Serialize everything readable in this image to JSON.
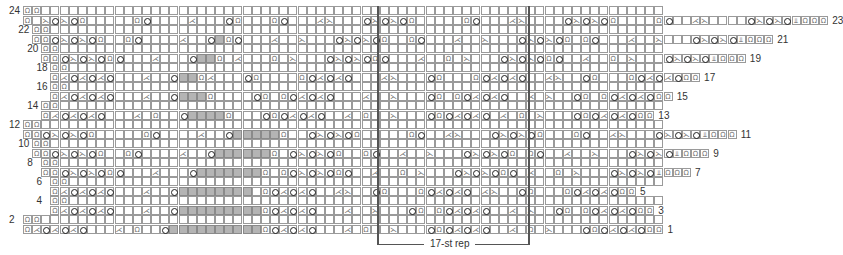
{
  "chart": {
    "cell_width": 9.15,
    "cell_height": 9.5,
    "origin_x": 23,
    "origin_y": 6,
    "colors": {
      "grid": "#9a9a9a",
      "no_stitch": "#b4b4b4",
      "symbol": "#222222",
      "bracket": "#555555"
    },
    "symbol_legend": {
      "O": "yarn-over",
      "R": "ssk-right-slant",
      "L": "k2tog-left-slant",
      "Q": "twisted-knit",
      "D": "double-decrease",
      ".": "knit",
      "#": "no-stitch"
    },
    "rows": [
      {
        "num": 24,
        "side": "left",
        "start": 0,
        "cells": "QQ"
      },
      {
        "num": 23,
        "side": "right",
        "start": 0,
        "cells": "QQO R O R O Q . . . . . Q O . . . . L . . . O Q . . . Q O . . . L R . . . O R O R O Q . . . . . Q O . . . L R . . . . O R O R O Q . . . . Q O . . L R . . . . O R O R O D Q QQ"
      },
      {
        "num": 22,
        "side": "left",
        "start": 1,
        "cells": "QQ"
      },
      {
        "num": 21,
        "side": "right",
        "start": 1,
        "cells": "Q Q O R O R O Q . . Q O . . . . L . . O # Q O . . . L . . R . . . O R O R O Q . . Q O . . . L . . R . . . O R O R O Q . Q O . . . L . . R . . . O R O R O D Q QQ"
      },
      {
        "num": 20,
        "side": "left",
        "start": 2,
        "cells": "QQ"
      },
      {
        "num": 19,
        "side": "right",
        "start": 2,
        "cells": "Q Q O R O R O Q O . . . L . . . O # # Q . L . . . Q . R . . . O R O R O Q O . . . L . . Q . R . . . O R O R O Q O . . L . . Q . R . . . O R O R O D Q QQ"
      },
      {
        "num": 18,
        "side": "left",
        "start": 3,
        "cells": "QQ"
      },
      {
        "num": 17,
        "side": "right",
        "start": 3,
        "cells": "Q L O L O L O . . . L . . O # # Q L . . . O Q . . . . Q O L O L O . . . L R . . . O Q . . . Q O L O L O . . L R . . O Q . . . Q O L O L O Q Q"
      },
      {
        "num": 16,
        "side": "left",
        "start": 3,
        "cells": "QQ"
      },
      {
        "num": 15,
        "side": "right",
        "start": 3,
        "cells": "Q L O L O L O . . . L . . O # # # Q . . . . O Q . Q O L O L O . . . L . . R . . . O Q . Q O L O L O . . L . R . . O Q . Q O L O L O Q Q"
      },
      {
        "num": 14,
        "side": "left",
        "start": 2,
        "cells": "QQ"
      },
      {
        "num": 13,
        "side": "right",
        "start": 2,
        "cells": "Q L O L O L O . . . L . Q . . O # # # # Q . . . O Q O L O L O . . L . Q . . R . . . O Q O L O L O . L . Q . R . . . O Q O L O L O Q Q"
      },
      {
        "num": 12,
        "side": "left",
        "start": 0,
        "cells": "QQ"
      },
      {
        "num": 11,
        "side": "right",
        "start": 0,
        "cells": "Q Q O R O R O Q . . . . . Q O . . . . L . . O # # # # # Q . . O R O R O Q . . . . . Q O . . L R . . . O R O R O Q . . . Q O . . L R . . . O R O R O D Q QQ"
      },
      {
        "num": 10,
        "side": "left",
        "start": 1,
        "cells": "QQ"
      },
      {
        "num": 9,
        "side": "right",
        "start": 1,
        "cells": "Q Q O R O R O Q . . Q O . . . . L . . O # # # # # # Q . O R O R O Q . . Q O . . L . . R . . . O R O R O Q . Q O . . L . . R . . . O R O R O D Q QQ"
      },
      {
        "num": 8,
        "side": "left",
        "start": 2,
        "cells": "QQ"
      },
      {
        "num": 7,
        "side": "right",
        "start": 2,
        "cells": "Q Q O R O R O Q O . . . L . . . O # # # # # # # Q . Q O R O R O Q O . . L . . Q . R . . . O R O R O Q O . L . . Q . R . . . O R O R O D Q QQ"
      },
      {
        "num": 6,
        "side": "left",
        "start": 3,
        "cells": "QQ"
      },
      {
        "num": 5,
        "side": "right",
        "start": 3,
        "cells": "Q L O L O L O . . . L . . O # # # # # # # # . Q O L O L O . . L R . . O Q . . . Q O L O L O . L R . . O Q . . . Q O L O L O Q Q"
      },
      {
        "num": 4,
        "side": "left",
        "start": 3,
        "cells": "QQ"
      },
      {
        "num": 3,
        "side": "right",
        "start": 3,
        "cells": "Q L O L O L O . . . L . . O # # # # # # # # # Q O L O L O . . . L . . R . . . O Q . Q O L O L O . . L . R . . O Q . Q O L O L O Q Q"
      },
      {
        "num": 2,
        "side": "left",
        "start": 0,
        "cells": "QQ"
      },
      {
        "num": 1,
        "side": "right",
        "start": 0,
        "cells": "Q L O L O L O . . . L . Q . . O # # # # # # # # # # Q O L O L O . . . L . Q . . R . . . O Q O L O L O . . L . Q . R . . . O Q O L O L O Q Q"
      }
    ],
    "row_labels_left": [
      "24",
      "22",
      "20",
      "18",
      "16",
      "14",
      "12",
      "10",
      "8",
      "6",
      "4",
      "2"
    ],
    "row_labels_right": [
      "23",
      "21",
      "19",
      "17",
      "15",
      "13",
      "11",
      "9",
      "7",
      "5",
      "3",
      "1"
    ],
    "repeat": {
      "label": "17-st rep",
      "start_col": 39,
      "end_col": 56
    }
  }
}
